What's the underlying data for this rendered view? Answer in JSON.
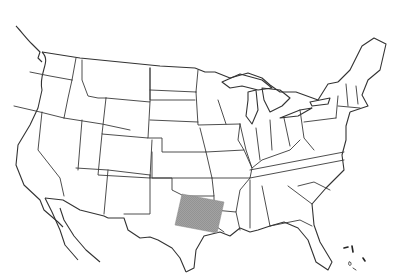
{
  "map": {
    "title": "",
    "region": "Contiguous United States",
    "style": "outline state boundaries",
    "highlight": {
      "label": "Shaded study area",
      "location": "East Texas",
      "fill_color": "#9a9a9a",
      "pattern": "dense hatching"
    },
    "colors": {
      "background": "#ffffff",
      "boundary": "#3a3a3a"
    }
  }
}
